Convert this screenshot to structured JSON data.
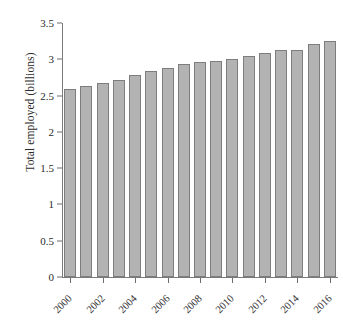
{
  "chart_data": {
    "type": "bar",
    "title": "",
    "xlabel": "",
    "ylabel": "Total employed (billions)",
    "categories": [
      "2000",
      "2001",
      "2002",
      "2003",
      "2004",
      "2005",
      "2006",
      "2007",
      "2008",
      "2009",
      "2010",
      "2011",
      "2012",
      "2013",
      "2014",
      "2015",
      "2016"
    ],
    "values": [
      2.59,
      2.63,
      2.67,
      2.72,
      2.78,
      2.84,
      2.88,
      2.93,
      2.96,
      2.97,
      3.01,
      3.05,
      3.09,
      3.13,
      3.13,
      3.21,
      3.25
    ],
    "ylim": [
      0,
      3.5
    ],
    "yticks": [
      0,
      0.5,
      1,
      1.5,
      2,
      2.5,
      3,
      3.5
    ],
    "ytick_labels": [
      "0",
      "0.5",
      "1",
      "1.5",
      "2",
      "2.5",
      "3",
      "3.5"
    ],
    "xtick_labels": [
      "2000",
      "2002",
      "2004",
      "2006",
      "2008",
      "2010",
      "2012",
      "2014",
      "2016"
    ],
    "xtick_categories": [
      "2000",
      "2002",
      "2004",
      "2006",
      "2008",
      "2010",
      "2012",
      "2014",
      "2016"
    ],
    "grid": false,
    "legend": null,
    "bar_color": "#b3b3b3",
    "bar_border_color": "#7d7d7d",
    "axis_color": "#7a7a7a",
    "text_color": "#2b2b2b",
    "background": "#ffffff"
  }
}
